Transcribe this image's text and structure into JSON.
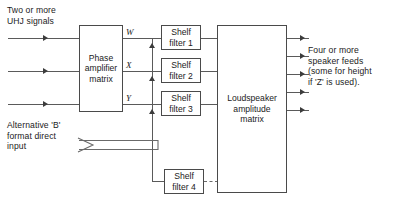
{
  "diagram": {
    "labels": {
      "input_top": "Two or more\nUHJ signals",
      "alt_input": "Alternative 'B'\nformat direct\ninput",
      "output_note": "Four or more\nspeaker feeds\n(some for height\nif 'Z' is used)."
    },
    "blocks": {
      "phase_matrix": "Phase\namplifier\nmatrix",
      "shelf_filter_1": "Shelf\nfilter 1",
      "shelf_filter_2": "Shelf\nfilter 2",
      "shelf_filter_3": "Shelf\nfilter 3",
      "shelf_filter_4": "Shelf\nfilter 4",
      "loudspeaker_matrix": "Loudspeaker\namplitude\nmatrix"
    },
    "channels": {
      "w": "W",
      "x": "X",
      "y": "Y"
    },
    "colors": {
      "stroke": "#4a4a4a",
      "wire": "#5a5a5a",
      "text": "#1b1b1b",
      "background": "#ffffff"
    },
    "counts": {
      "inputs": 3,
      "outputs": 5,
      "shelf_filters": 4
    }
  }
}
